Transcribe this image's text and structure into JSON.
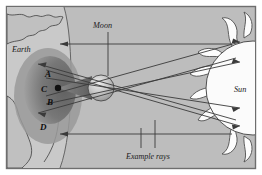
{
  "figure": {
    "type": "diagram",
    "frame": {
      "border_color": "#6e6e6e",
      "inner_background": "#bdbdbd",
      "outer_background": "#ffffff"
    },
    "labels": {
      "earth": "Earth",
      "moon": "Moon",
      "sun": "Sun",
      "example_rays": "Example rays"
    },
    "shadow_points": [
      {
        "id": "A",
        "label": "A",
        "x": 48,
        "y": 74
      },
      {
        "id": "C",
        "label": "C",
        "x": 45,
        "y": 89
      },
      {
        "id": "B",
        "label": "B",
        "x": 50,
        "y": 102
      },
      {
        "id": "D",
        "label": "D",
        "x": 43,
        "y": 127
      }
    ],
    "observer_dot": {
      "x": 58,
      "y": 88,
      "r": 3.2,
      "color": "#111111"
    },
    "bodies": {
      "earth": {
        "name": "Earth",
        "limb_color": "#cfcfcf",
        "land_color": "#c4c4c4",
        "umbra_color": "#6b6b6b",
        "penumbra_color": "#8f8f8f"
      },
      "moon": {
        "name": "Moon",
        "center_x": 101,
        "center_y": 88,
        "radius": 13,
        "fill_light": "#d8d8d8",
        "fill_dark": "#8a8a8a"
      },
      "sun": {
        "name": "Sun",
        "center_x": 253,
        "center_y": 88,
        "radius": 47,
        "fill": "#fbfbfb",
        "stroke": "#4d4d4d"
      }
    },
    "colors": {
      "ray_line": "#3a3a3a",
      "outline": "#4a4a4a",
      "label_text": "#1a1a1a",
      "leader_line": "#3a3a3a"
    },
    "ray_count": 8,
    "leader_lines": [
      {
        "from": "moon-label",
        "to": "moon-body"
      },
      {
        "from": "example-rays-label",
        "to": "ray-left-upper"
      },
      {
        "from": "example-rays-label",
        "to": "ray-left-lower"
      }
    ]
  }
}
